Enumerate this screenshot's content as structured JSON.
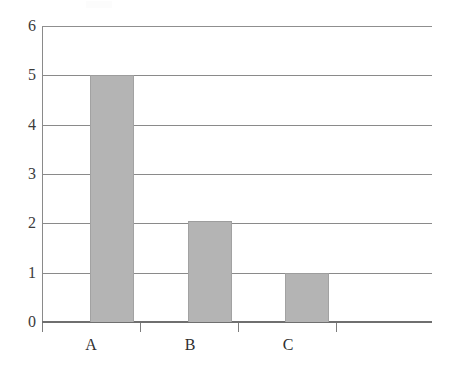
{
  "chart_data": {
    "type": "bar",
    "title": "",
    "subtitle": "",
    "xlabel": "",
    "ylabel": "",
    "categories": [
      "A",
      "B",
      "C"
    ],
    "values": [
      5,
      2.05,
      1
    ],
    "series": [
      {
        "name": "",
        "values": [
          5,
          2.05,
          1
        ]
      }
    ],
    "ylim": [
      0,
      6
    ],
    "yticks": [
      0,
      1,
      2,
      3,
      4,
      5,
      6
    ],
    "ytick_labels": [
      "0",
      "1",
      "2",
      "3",
      "4",
      "5",
      "6"
    ],
    "xtick_labels": [
      "A",
      "B",
      "C"
    ],
    "grid": true,
    "grid_axis": "y",
    "legend": false,
    "legend_position": "none",
    "annotations": [],
    "bar_color": "#b4b4b4",
    "grid_color": "#8a8a8a",
    "axis_color": "#6f6f6f",
    "text_color": "#3b3b3b",
    "background_color": "#ffffff",
    "n_slots": 4
  },
  "axes": {
    "y": {
      "ticks": [
        {
          "label": "6",
          "value": 6
        },
        {
          "label": "5",
          "value": 5
        },
        {
          "label": "4",
          "value": 4
        },
        {
          "label": "3",
          "value": 3
        },
        {
          "label": "2",
          "value": 2
        },
        {
          "label": "1",
          "value": 1
        },
        {
          "label": "0",
          "value": 0
        }
      ]
    },
    "x": {
      "ticks": [
        {
          "label": "A",
          "value": 0
        },
        {
          "label": "B",
          "value": 1
        },
        {
          "label": "C",
          "value": 2
        },
        {
          "label": "",
          "value": 3
        }
      ]
    }
  }
}
